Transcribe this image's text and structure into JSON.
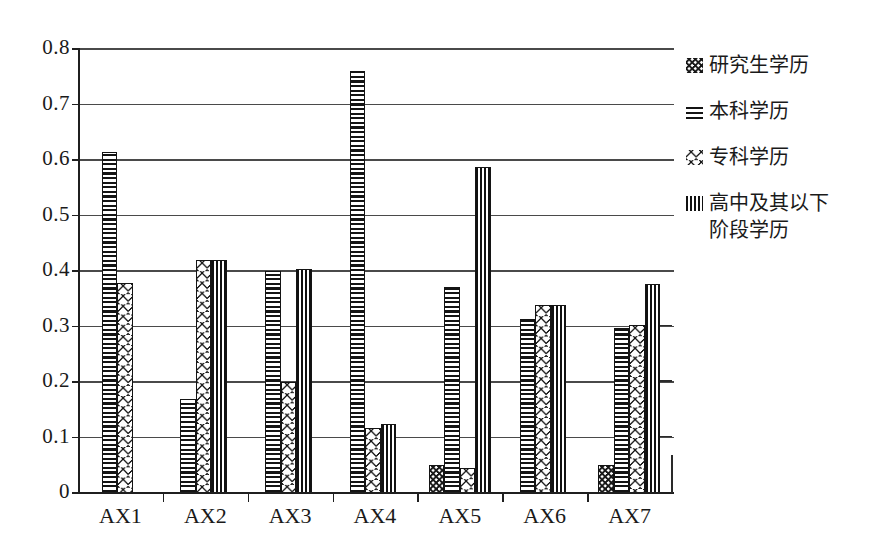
{
  "chart_data": {
    "type": "bar",
    "title": "",
    "subtitle": "",
    "xlabel": "",
    "ylabel": "",
    "categories": [
      "AX1",
      "AX2",
      "AX3",
      "AX4",
      "AX5",
      "AX6",
      "AX7"
    ],
    "ylim": [
      0,
      0.8
    ],
    "ytick_labels": [
      "0.8",
      "0.7",
      "0.6",
      "0.5",
      "0.4",
      "0.3",
      "0.2",
      "0.1",
      "0"
    ],
    "ytick_values": [
      0.8,
      0.7,
      0.6,
      0.5,
      0.4,
      0.3,
      0.2,
      0.1,
      0
    ],
    "grid": true,
    "legend_position": "right",
    "series": [
      {
        "name": "研究生学历",
        "pattern": "checker-dense",
        "values": [
          0,
          0,
          0,
          0,
          0.05,
          0,
          0.05
        ]
      },
      {
        "name": "本科学历",
        "pattern": "horizontal-lines",
        "values": [
          0.615,
          0.17,
          0.4,
          0.76,
          0.372,
          0.313,
          0.297
        ]
      },
      {
        "name": "专科学历",
        "pattern": "diamond-lattice",
        "values": [
          0.378,
          0.42,
          0.2,
          0.118,
          0.045,
          0.338,
          0.302
        ]
      },
      {
        "name": "高中及其以下阶段学历",
        "pattern": "vertical-lines-dense",
        "values": [
          0,
          0.42,
          0.403,
          0.125,
          0.588,
          0.338,
          0.377
        ]
      }
    ]
  },
  "legend": {
    "entries": [
      {
        "label": "研究生学历",
        "icon": "checker-swatch-icon"
      },
      {
        "label": "本科学历",
        "icon": "horizontal-lines-swatch-icon"
      },
      {
        "label": "专科学历",
        "icon": "diamond-lattice-swatch-icon"
      },
      {
        "label": "高中及其以下\n阶段学历",
        "icon": "vertical-lines-swatch-icon"
      }
    ]
  },
  "colors": {
    "ink": "#141414",
    "axis": "#1f1f1f",
    "grid": "#4a4a4a",
    "background": "#ffffff"
  }
}
